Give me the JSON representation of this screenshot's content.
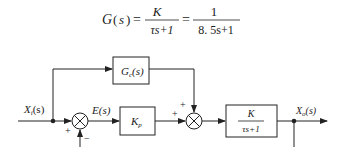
{
  "formula": {
    "lhs": "G(s)",
    "eq1": "=",
    "frac1_num": "K",
    "frac1_den": "τs+1",
    "eq2": "=",
    "frac2_num": "1",
    "frac2_den": "8. 5s+1"
  },
  "diagram": {
    "input_label": "X",
    "input_sub": "i",
    "input_arg": "(s)",
    "error_label": "E(s)",
    "feedforward_block": {
      "main": "G",
      "sub": "c",
      "arg": "(s)"
    },
    "controller_block": {
      "main": "K",
      "sub": "p"
    },
    "plant_block": {
      "num": "K",
      "den": "τs+1"
    },
    "output_label": "X",
    "output_sub": "o",
    "output_arg": "(s)",
    "sum1_signs": {
      "left": "+",
      "bottom": "−"
    },
    "sum2_signs": {
      "left": "+",
      "top": "+"
    },
    "colors": {
      "line": "#222222",
      "background": "#ffffff"
    }
  }
}
